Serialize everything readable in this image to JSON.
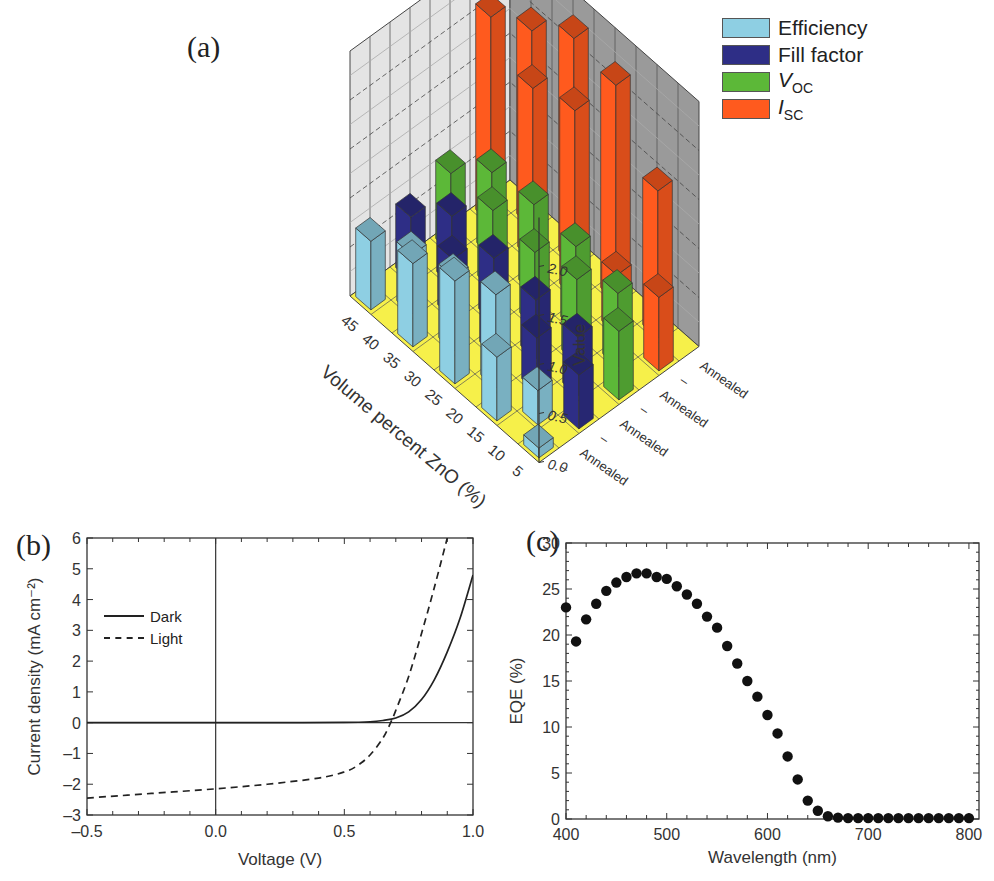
{
  "panels": {
    "a": {
      "label": "(a)"
    },
    "b": {
      "label": "(b)"
    },
    "c": {
      "label": "(c)"
    }
  },
  "chart_data": [
    {
      "id": "a",
      "type": "bar3d",
      "title": "",
      "zlabel": "Value",
      "xlabel": "Volume percent ZnO (%)",
      "x_categories": [
        "5",
        "10",
        "15",
        "20",
        "25",
        "30",
        "35",
        "40",
        "45"
      ],
      "y_categories": [
        "–",
        "Annealed",
        "–",
        "Annealed",
        "–",
        "Annealed",
        "–",
        "Annealed"
      ],
      "zlim": [
        0,
        2.5
      ],
      "zticks": [
        "0.0",
        "0.5",
        "1.0",
        "1.5",
        "2.0"
      ],
      "legend": [
        {
          "name": "Efficiency",
          "color": "#8ecfe3"
        },
        {
          "name": "Fill factor",
          "color": "#2e2e86"
        },
        {
          "name": "V_OC",
          "color": "#5cb838"
        },
        {
          "name": "I_SC",
          "color": "#ff5a1e"
        }
      ],
      "series": [
        {
          "name": "Efficiency",
          "row_pair": 0,
          "values": [
            0.1,
            0.35,
            0.65,
            0.95,
            1.05,
            0.75,
            0.85,
            0.6,
            0.7
          ]
        },
        {
          "name": "Fill factor",
          "row_pair": 1,
          "values": [
            0.55,
            0.6,
            0.55,
            0.6,
            0.6,
            0.65,
            0.6,
            0.7,
            0.65
          ]
        },
        {
          "name": "V_OC",
          "row_pair": 2,
          "values": [
            0.7,
            0.75,
            0.85,
            0.85,
            0.75,
            0.9,
            0.8,
            0.85,
            0.8
          ]
        },
        {
          "name": "I_SC",
          "row_pair": 3,
          "values": [
            0.75,
            1.5,
            0.6,
            2.2,
            1.9,
            2.3,
            1.75,
            2.0,
            2.1
          ]
        }
      ],
      "legend_position": "top-right",
      "grid": true
    },
    {
      "id": "b",
      "type": "line",
      "title": "",
      "xlabel": "Voltage (V)",
      "ylabel": "Current density (mA cm⁻²)",
      "xlim": [
        -0.5,
        1.0
      ],
      "ylim": [
        -3,
        6
      ],
      "xticks": [
        "–0.5",
        "0.0",
        "0.5",
        "1.0"
      ],
      "yticks": [
        "–3",
        "–2",
        "–1",
        "0",
        "1",
        "2",
        "3",
        "4",
        "5",
        "6"
      ],
      "legend": [
        {
          "name": "Dark",
          "style": "solid"
        },
        {
          "name": "Light",
          "style": "dashed"
        }
      ],
      "legend_position": "upper-left",
      "grid": false,
      "series": [
        {
          "name": "Dark",
          "style": "solid",
          "x": [
            -0.5,
            -0.25,
            0.0,
            0.25,
            0.5,
            0.6,
            0.65,
            0.7,
            0.75,
            0.8,
            0.85,
            0.9,
            0.95,
            1.0
          ],
          "y": [
            0.0,
            0.0,
            0.0,
            0.0,
            0.01,
            0.03,
            0.07,
            0.15,
            0.35,
            0.75,
            1.4,
            2.3,
            3.4,
            4.8
          ]
        },
        {
          "name": "Light",
          "style": "dashed",
          "x": [
            -0.5,
            -0.25,
            0.0,
            0.2,
            0.4,
            0.5,
            0.55,
            0.6,
            0.65,
            0.68,
            0.7,
            0.75,
            0.8,
            0.85,
            0.9
          ],
          "y": [
            -2.45,
            -2.3,
            -2.15,
            -2.0,
            -1.8,
            -1.6,
            -1.4,
            -1.05,
            -0.5,
            0.0,
            0.4,
            1.5,
            2.9,
            4.4,
            6.0
          ]
        }
      ]
    },
    {
      "id": "c",
      "type": "scatter",
      "title": "",
      "xlabel": "Wavelength (nm)",
      "ylabel": "EQE (%)",
      "xlim": [
        400,
        810
      ],
      "ylim": [
        0,
        30
      ],
      "xticks": [
        "400",
        "500",
        "600",
        "700",
        "800"
      ],
      "yticks": [
        "0",
        "5",
        "10",
        "15",
        "20",
        "25",
        "30"
      ],
      "grid": false,
      "series": [
        {
          "name": "EQE",
          "x": [
            400,
            410,
            420,
            430,
            440,
            450,
            460,
            470,
            480,
            490,
            500,
            510,
            520,
            530,
            540,
            550,
            560,
            570,
            580,
            590,
            600,
            610,
            620,
            630,
            640,
            650,
            660,
            670,
            680,
            690,
            700,
            710,
            720,
            730,
            740,
            750,
            760,
            770,
            780,
            790,
            800
          ],
          "y": [
            23.0,
            19.3,
            21.7,
            23.4,
            24.8,
            25.7,
            26.3,
            26.7,
            26.7,
            26.3,
            26.1,
            25.3,
            24.4,
            23.4,
            22.0,
            20.8,
            18.8,
            16.9,
            15.0,
            13.3,
            11.3,
            9.3,
            6.8,
            4.3,
            2.0,
            0.9,
            0.3,
            0.15,
            0.1,
            0.1,
            0.1,
            0.1,
            0.1,
            0.1,
            0.1,
            0.1,
            0.1,
            0.1,
            0.1,
            0.1,
            0.1
          ]
        }
      ]
    }
  ]
}
